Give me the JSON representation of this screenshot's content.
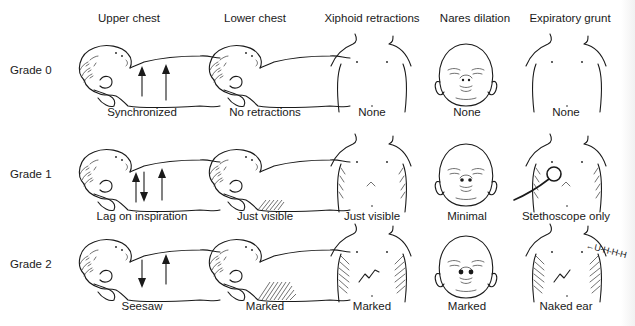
{
  "diagram": {
    "columns": [
      {
        "key": "upper_chest",
        "label": "Upper chest"
      },
      {
        "key": "lower_chest",
        "label": "Lower chest"
      },
      {
        "key": "xiphoid",
        "label": "Xiphoid retractions"
      },
      {
        "key": "nares",
        "label": "Nares dilation"
      },
      {
        "key": "grunt",
        "label": "Expiratory grunt"
      }
    ],
    "rows": [
      {
        "label": "Grade 0",
        "cells": [
          "Synchronized",
          "No retractions",
          "None",
          "None",
          "None"
        ]
      },
      {
        "label": "Grade 1",
        "cells": [
          "Lag on inspiration",
          "Just visible",
          "Just visible",
          "Minimal",
          "Stethoscope only"
        ]
      },
      {
        "label": "Grade 2",
        "cells": [
          "Seesaw",
          "Marked",
          "Marked",
          "Marked",
          "Naked ear"
        ]
      }
    ],
    "annotations": {
      "grunt_sound": "U-H-H-H"
    },
    "icons": {
      "infant_side": "infant-side-profile-icon",
      "torso_front": "infant-torso-front-icon",
      "face_front": "infant-face-front-icon",
      "stethoscope": "stethoscope-icon",
      "arrow_up": "arrow-up-icon",
      "arrow_down": "arrow-down-icon"
    },
    "colors": {
      "ink": "#1a1a1a",
      "background": "#ffffff"
    }
  }
}
